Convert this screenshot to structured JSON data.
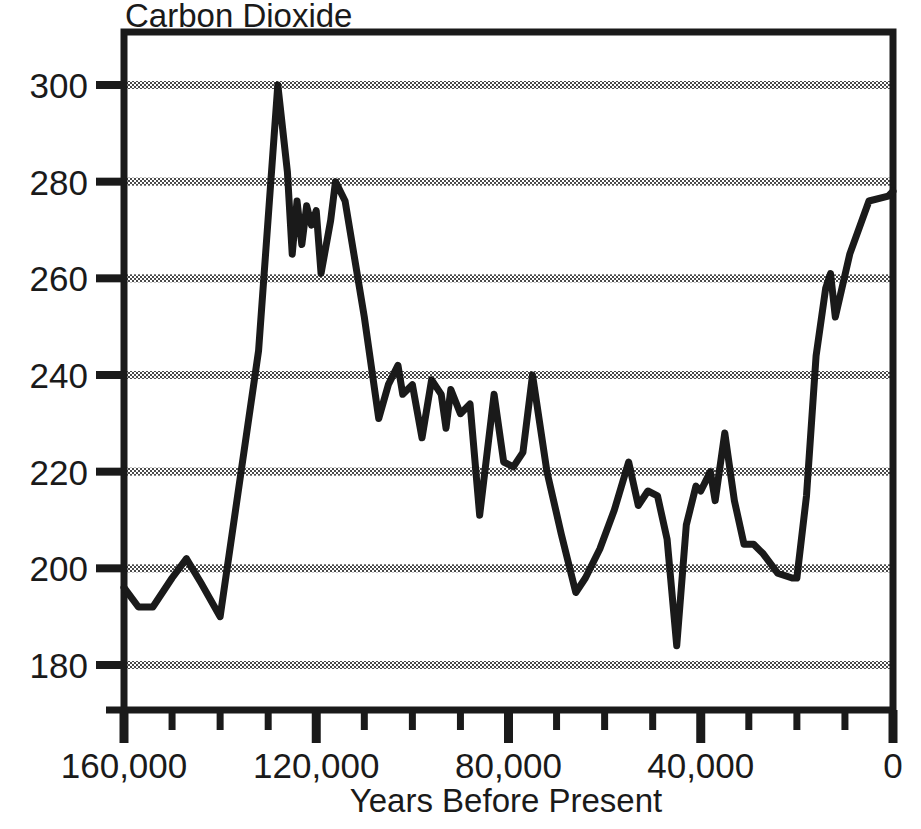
{
  "chart_data": {
    "type": "line",
    "title": "Carbon Dioxide",
    "xlabel": "Years Before Present",
    "ylabel": "",
    "xlim": [
      160000,
      0
    ],
    "ylim": [
      170,
      308
    ],
    "x_reversed": true,
    "grid": "horizontal-dotted",
    "legend": "none",
    "xtick_labels": [
      "160,000",
      "120,000",
      "80,000",
      "40,000",
      "0"
    ],
    "xtick_values": [
      160000,
      120000,
      80000,
      40000,
      0
    ],
    "xtick_minor_step": 10000,
    "ytick_labels": [
      "300",
      "280",
      "260",
      "240",
      "220",
      "200",
      "180"
    ],
    "ytick_values": [
      300,
      280,
      260,
      240,
      220,
      200,
      180
    ],
    "series": [
      {
        "name": "Carbon Dioxide (ppm)",
        "units": "ppm",
        "color": "#1a1a1a",
        "points": [
          [
            160000,
            196
          ],
          [
            157000,
            192
          ],
          [
            154000,
            192
          ],
          [
            150000,
            198
          ],
          [
            147000,
            202
          ],
          [
            144000,
            197
          ],
          [
            140000,
            190
          ],
          [
            132000,
            245
          ],
          [
            128000,
            300
          ],
          [
            126000,
            282
          ],
          [
            125000,
            265
          ],
          [
            124000,
            276
          ],
          [
            123000,
            267
          ],
          [
            122000,
            275
          ],
          [
            121000,
            271
          ],
          [
            120000,
            274
          ],
          [
            119000,
            261
          ],
          [
            117000,
            272
          ],
          [
            116000,
            280
          ],
          [
            114000,
            276
          ],
          [
            110000,
            252
          ],
          [
            107000,
            231
          ],
          [
            105000,
            238
          ],
          [
            103000,
            242
          ],
          [
            102000,
            236
          ],
          [
            100000,
            238
          ],
          [
            98000,
            227
          ],
          [
            96000,
            239
          ],
          [
            94000,
            236
          ],
          [
            93000,
            229
          ],
          [
            92000,
            237
          ],
          [
            90000,
            232
          ],
          [
            88000,
            234
          ],
          [
            86000,
            211
          ],
          [
            83000,
            236
          ],
          [
            81000,
            222
          ],
          [
            79000,
            221
          ],
          [
            77000,
            224
          ],
          [
            75000,
            240
          ],
          [
            72000,
            220
          ],
          [
            69000,
            207
          ],
          [
            66000,
            195
          ],
          [
            64000,
            198
          ],
          [
            61000,
            204
          ],
          [
            58000,
            212
          ],
          [
            55000,
            222
          ],
          [
            53000,
            213
          ],
          [
            51000,
            216
          ],
          [
            49000,
            215
          ],
          [
            47000,
            206
          ],
          [
            45000,
            184
          ],
          [
            43000,
            209
          ],
          [
            41000,
            217
          ],
          [
            40000,
            216
          ],
          [
            38000,
            220
          ],
          [
            37000,
            214
          ],
          [
            35000,
            228
          ],
          [
            33000,
            214
          ],
          [
            31000,
            205
          ],
          [
            29000,
            205
          ],
          [
            27000,
            203
          ],
          [
            24000,
            199
          ],
          [
            21000,
            198
          ],
          [
            20000,
            198
          ],
          [
            18000,
            215
          ],
          [
            16000,
            244
          ],
          [
            14000,
            258
          ],
          [
            13000,
            261
          ],
          [
            12000,
            252
          ],
          [
            9000,
            265
          ],
          [
            5000,
            276
          ],
          [
            1000,
            277
          ],
          [
            0,
            278
          ]
        ]
      }
    ]
  },
  "plot": {
    "frame_color": "#1a1a1a",
    "gridline_color": "#555555",
    "line_color": "#1a1a1a"
  }
}
